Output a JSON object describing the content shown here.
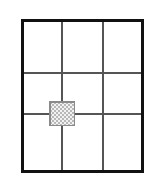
{
  "canvas": {
    "width": 155,
    "height": 182,
    "background_color": "#ffffff"
  },
  "diagram": {
    "frame": {
      "label": "outer-frame",
      "x": 21,
      "y": 19,
      "width": 123,
      "height": 154,
      "stroke_color": "#111111",
      "stroke_width": 3,
      "fill_color": "#ffffff"
    },
    "grid": {
      "label": "interior-grid",
      "columns": 3,
      "rows": 3,
      "stroke_color": "#555555",
      "stroke_width": 1.2,
      "vertical_lines_x": [
        62,
        103
      ],
      "horizontal_lines_y": [
        73,
        114
      ]
    },
    "marker": {
      "label": "hatched-square",
      "x": 49,
      "y": 101,
      "width": 26,
      "height": 25,
      "center_x": 62,
      "center_y": 113.5,
      "stroke_color": "#8a8a8a",
      "stroke_width": 1.5,
      "fill_pattern": "checkerboard-hatch",
      "pattern_color": "#b8b8b8",
      "pattern_background": "#f2f2f2",
      "pattern_cell_size": 2,
      "anchored_to": "grid-intersection-col1-row2"
    }
  }
}
